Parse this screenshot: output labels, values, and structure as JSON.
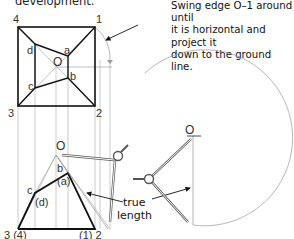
{
  "caption": {
    "title_fragment": "development.",
    "note_lines": [
      "Swing edge O–1 around until",
      "it is horizontal and project it",
      "down to the ground line."
    ]
  },
  "plan_view": {
    "corner_labels": {
      "c4": "4",
      "c1": "1",
      "c3": "3",
      "c2": "2"
    },
    "apex_label": "O",
    "inner_labels": {
      "a": "a",
      "b": "b",
      "c": "c",
      "d": "d"
    }
  },
  "elevation_view": {
    "apex_label": "O",
    "labels": {
      "b": "b",
      "a": "(a)",
      "c": "c",
      "d": "(d)",
      "left_base": "3 (4)",
      "right_base": "(1) 2"
    }
  },
  "true_length": {
    "label_line1": "true",
    "label_line2": "length",
    "apex_label": "O"
  },
  "colors": {
    "thick_line": "#111111",
    "thin_line": "#8a8a8a",
    "construction": "#9a9a9a"
  }
}
